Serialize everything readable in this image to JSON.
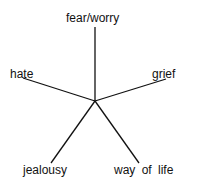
{
  "diagram": {
    "type": "radial-spoke",
    "labels": {
      "top": "fear/worry",
      "left": "hate",
      "right": "grief",
      "bottom_left": "jealousy",
      "bottom_right": "way of life"
    },
    "line_color": "#111111"
  }
}
